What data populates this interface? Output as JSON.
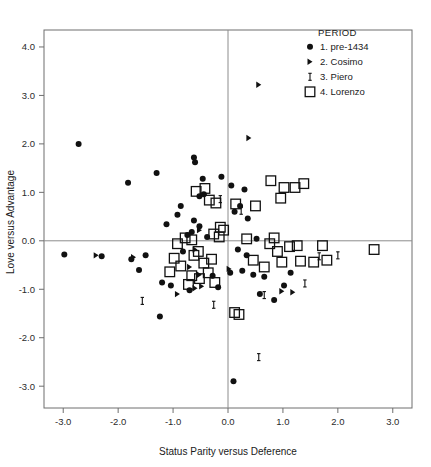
{
  "chart_data": {
    "type": "scatter",
    "title": "",
    "xlabel": "Status Parity versus Deference",
    "ylabel": "Love versus Advantage",
    "xlim": [
      -3.35,
      3.35
    ],
    "ylim": [
      -3.45,
      4.35
    ],
    "xticks": [
      -3.0,
      -2.0,
      -1.0,
      0.0,
      1.0,
      2.0,
      3.0
    ],
    "yticks": [
      4.0,
      3.0,
      2.0,
      1.0,
      0.0,
      -1.0,
      -2.0,
      -3.0
    ],
    "xticklabels": [
      "-3.0",
      "-2.0",
      "-1.0",
      "0.0",
      "1.0",
      "2.0",
      "3.0"
    ],
    "yticklabels": [
      "4.0",
      "3.0",
      "2.0",
      "1.0",
      "0.0",
      "-1.0",
      "-2.0",
      "-3.0"
    ],
    "grid": false,
    "reference_lines": {
      "x": 0.0,
      "y": 0.0
    },
    "legend": {
      "title": "PERIOD",
      "position": "top-right-inside",
      "entries": [
        {
          "label": "1. pre-1434",
          "marker": "filled-circle"
        },
        {
          "label": "2. Cosimo",
          "marker": "right-triangle"
        },
        {
          "label": "3. Piero",
          "marker": "i-bar"
        },
        {
          "label": "4. Lorenzo",
          "marker": "open-square"
        }
      ]
    },
    "series": [
      {
        "name": "1. pre-1434",
        "marker": "filled-circle",
        "points": [
          [
            -2.72,
            2.0
          ],
          [
            -1.82,
            1.2
          ],
          [
            -1.3,
            1.4
          ],
          [
            -0.62,
            1.72
          ],
          [
            -0.6,
            1.62
          ],
          [
            -0.46,
            1.28
          ],
          [
            -0.52,
            0.92
          ],
          [
            -0.44,
            0.96
          ],
          [
            -0.92,
            0.54
          ],
          [
            -1.12,
            0.34
          ],
          [
            -0.62,
            0.42
          ],
          [
            -0.52,
            0.3
          ],
          [
            -0.66,
            0.18
          ],
          [
            -0.74,
            0.12
          ],
          [
            -0.38,
            0.08
          ],
          [
            -1.5,
            -0.3
          ],
          [
            -0.82,
            -0.22
          ],
          [
            -2.98,
            -0.28
          ],
          [
            -2.3,
            -0.32
          ],
          [
            -1.76,
            -0.38
          ],
          [
            -1.62,
            -0.6
          ],
          [
            -1.2,
            -0.86
          ],
          [
            -1.04,
            -0.92
          ],
          [
            -1.24,
            -1.56
          ],
          [
            -0.12,
            1.32
          ],
          [
            0.06,
            1.14
          ],
          [
            0.3,
            1.06
          ],
          [
            0.22,
            0.72
          ],
          [
            0.12,
            0.6
          ],
          [
            0.36,
            0.46
          ],
          [
            0.52,
            0.04
          ],
          [
            0.18,
            -0.18
          ],
          [
            0.34,
            -0.3
          ],
          [
            0.26,
            -0.62
          ],
          [
            0.46,
            -0.7
          ],
          [
            0.66,
            -0.74
          ],
          [
            0.58,
            -1.1
          ],
          [
            0.84,
            -1.22
          ],
          [
            1.02,
            -0.92
          ],
          [
            0.1,
            -2.9
          ],
          [
            -0.28,
            -0.72
          ],
          [
            -0.18,
            -0.96
          ],
          [
            0.04,
            -0.66
          ],
          [
            -0.86,
            0.72
          ],
          [
            -0.7,
            -1.02
          ],
          [
            1.14,
            -0.66
          ]
        ]
      },
      {
        "name": "2. Cosimo",
        "marker": "right-triangle",
        "points": [
          [
            0.56,
            3.22
          ],
          [
            0.38,
            2.12
          ],
          [
            -0.52,
            0.22
          ],
          [
            -0.6,
            -0.18
          ],
          [
            -0.7,
            -0.54
          ],
          [
            -0.52,
            -0.7
          ],
          [
            -2.4,
            -0.3
          ],
          [
            -1.72,
            -0.34
          ],
          [
            -0.48,
            -0.94
          ],
          [
            -0.6,
            -0.98
          ],
          [
            0.98,
            -1.04
          ],
          [
            1.18,
            -1.06
          ],
          [
            -0.92,
            -1.1
          ],
          [
            0.02,
            -0.58
          ]
        ]
      },
      {
        "name": "3. Piero",
        "marker": "i-bar",
        "points": [
          [
            -0.14,
            0.86
          ],
          [
            0.24,
            0.62
          ],
          [
            -1.56,
            -1.24
          ],
          [
            1.66,
            -0.32
          ],
          [
            1.4,
            -0.88
          ],
          [
            0.66,
            -1.12
          ],
          [
            0.56,
            -2.4
          ],
          [
            2.0,
            -0.3
          ],
          [
            -0.26,
            -1.32
          ]
        ]
      },
      {
        "name": "4. Lorenzo",
        "marker": "open-square",
        "points": [
          [
            -0.58,
            1.02
          ],
          [
            -0.42,
            1.08
          ],
          [
            -0.34,
            0.84
          ],
          [
            -0.22,
            0.78
          ],
          [
            0.14,
            0.76
          ],
          [
            1.02,
            1.1
          ],
          [
            1.22,
            1.1
          ],
          [
            1.38,
            1.18
          ],
          [
            0.78,
            1.24
          ],
          [
            0.96,
            0.88
          ],
          [
            0.5,
            0.72
          ],
          [
            -0.14,
            0.28
          ],
          [
            -0.08,
            0.22
          ],
          [
            -0.26,
            0.14
          ],
          [
            -0.16,
            0.08
          ],
          [
            -0.66,
            0.02
          ],
          [
            -0.78,
            0.06
          ],
          [
            -0.92,
            -0.06
          ],
          [
            -0.54,
            -0.22
          ],
          [
            -0.62,
            -0.3
          ],
          [
            -0.3,
            -0.38
          ],
          [
            -0.44,
            -0.46
          ],
          [
            -0.86,
            -0.52
          ],
          [
            -0.98,
            -0.36
          ],
          [
            -0.66,
            -0.72
          ],
          [
            -0.52,
            -0.78
          ],
          [
            -0.36,
            -0.66
          ],
          [
            -0.24,
            -0.86
          ],
          [
            -0.72,
            -0.9
          ],
          [
            0.9,
            -0.22
          ],
          [
            1.12,
            -0.12
          ],
          [
            1.26,
            -0.1
          ],
          [
            0.98,
            -0.44
          ],
          [
            1.32,
            -0.42
          ],
          [
            1.56,
            -0.44
          ],
          [
            1.8,
            -0.4
          ],
          [
            2.66,
            -0.18
          ],
          [
            0.84,
            0.06
          ],
          [
            0.76,
            -0.06
          ],
          [
            0.66,
            -0.54
          ],
          [
            0.46,
            -0.4
          ],
          [
            0.12,
            -1.48
          ],
          [
            0.2,
            -1.52
          ],
          [
            1.72,
            -0.1
          ],
          [
            -1.06,
            -0.64
          ],
          [
            0.34,
            0.04
          ]
        ]
      }
    ]
  }
}
